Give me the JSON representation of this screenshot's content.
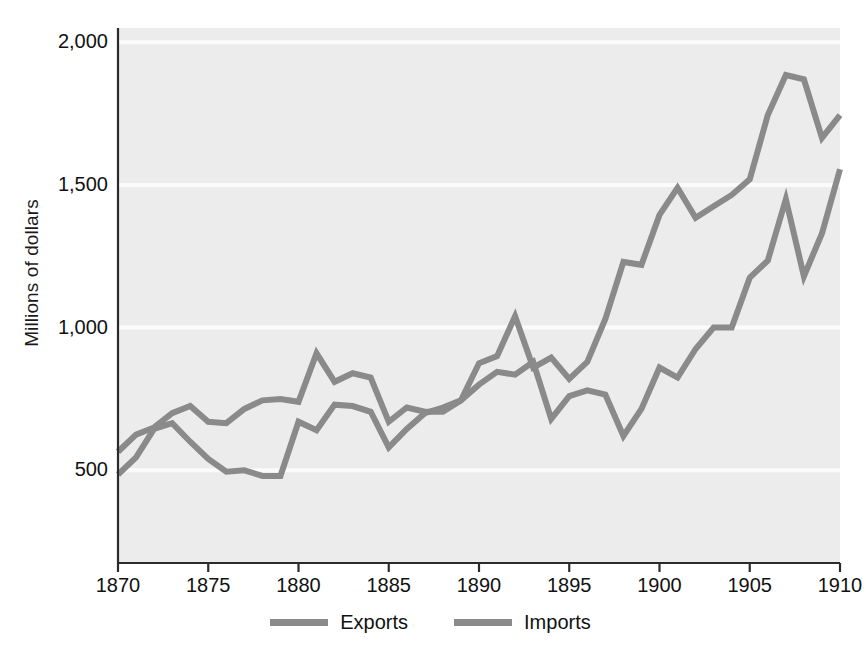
{
  "figure": {
    "background_color": "#ffffff",
    "plot_background_color": "#ececec",
    "gridline_color": "#fbfbfb",
    "axis_color": "#2b2b2b",
    "series_color": "#8a8a8a",
    "y_axis_title": "Millions of dollars"
  },
  "legend": {
    "position": "bottom-center",
    "items": [
      {
        "label": "Exports",
        "color": "#8a8a8a",
        "swatch": "line-swatch"
      },
      {
        "label": "Imports",
        "color": "#8a8a8a",
        "swatch": "line-swatch"
      }
    ]
  },
  "axes": {
    "y_ticks": [
      {
        "value": 2000,
        "label": "2,000"
      },
      {
        "value": 1500,
        "label": "1,500"
      },
      {
        "value": 1000,
        "label": "1,000"
      },
      {
        "value": 500,
        "label": "500"
      }
    ],
    "x_ticks": [
      {
        "value": 1870,
        "label": "1870"
      },
      {
        "value": 1875,
        "label": "1875"
      },
      {
        "value": 1880,
        "label": "1880"
      },
      {
        "value": 1885,
        "label": "1885"
      },
      {
        "value": 1890,
        "label": "1890"
      },
      {
        "value": 1895,
        "label": "1895"
      },
      {
        "value": 1900,
        "label": "1900"
      },
      {
        "value": 1905,
        "label": "1905"
      },
      {
        "value": 1910,
        "label": "1910"
      }
    ]
  },
  "chart_data": {
    "type": "line",
    "title": "",
    "subtitle": "",
    "xlabel": "",
    "ylabel": "Millions of dollars",
    "xlim": [
      1870,
      1910
    ],
    "ylim": [
      175,
      2050
    ],
    "grid": true,
    "legend_position": "bottom",
    "x": [
      1870,
      1871,
      1872,
      1873,
      1874,
      1875,
      1876,
      1877,
      1878,
      1879,
      1880,
      1881,
      1882,
      1883,
      1884,
      1885,
      1886,
      1887,
      1888,
      1889,
      1890,
      1891,
      1892,
      1893,
      1894,
      1895,
      1896,
      1897,
      1898,
      1899,
      1900,
      1901,
      1902,
      1903,
      1904,
      1905,
      1906,
      1907,
      1908,
      1909,
      1910
    ],
    "series": [
      {
        "name": "Exports",
        "color": "#8a8a8a",
        "values": [
          565,
          625,
          650,
          700,
          725,
          670,
          665,
          715,
          745,
          750,
          740,
          910,
          810,
          840,
          825,
          670,
          720,
          705,
          705,
          745,
          875,
          900,
          1040,
          860,
          895,
          820,
          880,
          1030,
          1230,
          1220,
          1395,
          1490,
          1385,
          1425,
          1465,
          1520,
          1745,
          1885,
          1870,
          1665,
          1745
        ]
      },
      {
        "name": "Imports",
        "color": "#8a8a8a",
        "values": [
          485,
          545,
          645,
          665,
          600,
          540,
          495,
          500,
          480,
          480,
          670,
          640,
          730,
          725,
          705,
          580,
          645,
          700,
          720,
          745,
          800,
          845,
          835,
          880,
          680,
          760,
          780,
          765,
          620,
          715,
          860,
          825,
          925,
          1000,
          1000,
          1175,
          1235,
          1450,
          1180,
          1330,
          1555
        ]
      }
    ]
  }
}
